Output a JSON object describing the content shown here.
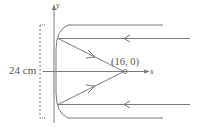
{
  "figure": {
    "type": "parabolic-mirror-ray-diagram",
    "axes": {
      "x_label": "x",
      "y_label": "y"
    },
    "dimension_label": "24 cm",
    "focus_label": "(16, 0)",
    "focus": {
      "x": 16,
      "y": 0
    },
    "rays": [
      {
        "id": "top-outer",
        "direction": "incoming-left",
        "reflects_to_focus": false
      },
      {
        "id": "top-inner",
        "direction": "incoming-left",
        "reflects_to_focus": true
      },
      {
        "id": "bottom-inner",
        "direction": "incoming-left",
        "reflects_to_focus": true
      },
      {
        "id": "bottom-outer",
        "direction": "incoming-left",
        "reflects_to_focus": false
      }
    ],
    "colors": {
      "line": "#7a7a7a",
      "text": "#555555",
      "background": "#ffffff"
    }
  }
}
